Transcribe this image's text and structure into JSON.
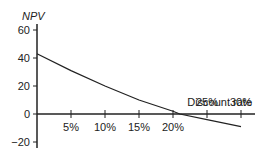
{
  "chart_data": {
    "type": "line",
    "title": "",
    "xlabel": "Discount rate",
    "ylabel": "NPV",
    "x_ticks": [
      "5%",
      "10%",
      "15%",
      "20%",
      "25%",
      "30%"
    ],
    "y_ticks": [
      "60",
      "40",
      "20",
      "0",
      "−20"
    ],
    "xlim": [
      0,
      30
    ],
    "ylim": [
      -20,
      60
    ],
    "grid": false,
    "series": [
      {
        "name": "NPV",
        "x": [
          0,
          5,
          10,
          15,
          20,
          21,
          25,
          30
        ],
        "y": [
          43,
          31,
          20,
          10,
          2,
          0,
          -4,
          -9
        ]
      }
    ]
  }
}
